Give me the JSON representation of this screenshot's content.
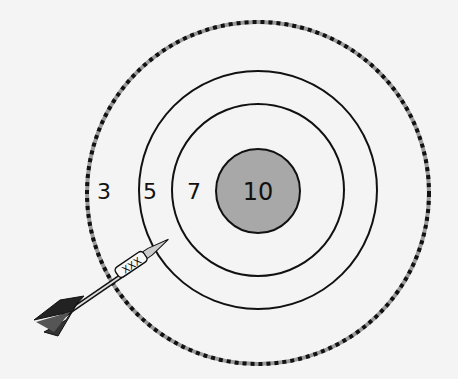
{
  "target": {
    "rings": [
      {
        "score": "3",
        "radius": 172,
        "style": "dashed"
      },
      {
        "score": "5",
        "radius": 118,
        "style": "solid"
      },
      {
        "score": "7",
        "radius": 85,
        "style": "solid"
      },
      {
        "score": "10",
        "radius": 42,
        "style": "filled"
      }
    ],
    "labels": {
      "three": "3",
      "five": "5",
      "seven": "7",
      "ten": "10"
    },
    "colors": {
      "background": "#f4f4f4",
      "ring": "#111111",
      "bullseye_fill": "#a8a8a8",
      "dash_gray": "#9a9a9a"
    }
  },
  "dart": {
    "barrel_text": "XXX"
  }
}
